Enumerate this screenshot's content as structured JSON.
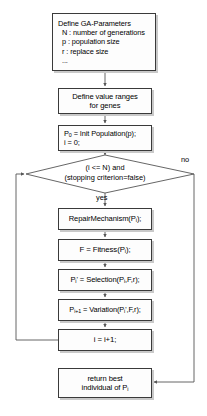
{
  "diagram": {
    "type": "flowchart",
    "colors": {
      "node_fill": "#fdfdfd",
      "node_border": "#3a3a3a",
      "shadow": "#c9c9c9",
      "line": "#555555",
      "background": "#ffffff"
    },
    "nodes": [
      {
        "id": "define-ga-parameters",
        "shape": "process",
        "lines": [
          "Define GA-Parameters",
          "N : number of generations",
          "p : population size",
          "r : replace size",
          "..."
        ]
      },
      {
        "id": "define-value-ranges",
        "shape": "process",
        "lines": [
          "Define value ranges",
          "for genes"
        ]
      },
      {
        "id": "init-population",
        "shape": "process",
        "lines": [
          "P0 = Init Population(p);",
          "i = 0;"
        ]
      },
      {
        "id": "loop-condition",
        "shape": "decision",
        "lines": [
          "(i <= N) and",
          "(stopping criterion=false)"
        ]
      },
      {
        "id": "repair-mechanism",
        "shape": "process",
        "lines": [
          "RepairMechanism(Pi);"
        ]
      },
      {
        "id": "fitness",
        "shape": "process",
        "lines": [
          "F = Fitness(Pi);"
        ]
      },
      {
        "id": "selection",
        "shape": "process",
        "lines": [
          "Pi' = Selection(Pi,F,r);"
        ]
      },
      {
        "id": "variation",
        "shape": "process",
        "lines": [
          "Pi+1 = Variation(Pi',F,r);"
        ]
      },
      {
        "id": "increment",
        "shape": "process",
        "lines": [
          "i = i+1;"
        ]
      },
      {
        "id": "return-best",
        "shape": "process",
        "lines": [
          "return best",
          "individual of Pi"
        ]
      }
    ],
    "edge_labels": {
      "yes": "yes",
      "no": "no"
    },
    "text": {
      "params_title": "Define GA-Parameters",
      "params_n": "N : number of generations",
      "params_p": "p : population size",
      "params_r": "r : replace size",
      "params_dots": "...",
      "ranges_l1": "Define value ranges",
      "ranges_l2": "for genes",
      "init_l1_pre": "P",
      "init_l1_sub": "0",
      "init_l1_post": " = Init Population(p);",
      "init_l2": "i = 0;",
      "cond_l1": "(i <= N) and",
      "cond_l2": "(stopping criterion=false)",
      "repair_pre": "RepairMechanism(P",
      "repair_sub": "i",
      "repair_post": ");",
      "fitness_pre": "F = Fitness(P",
      "fitness_sub": "i",
      "fitness_post": ");",
      "sel_pre": "P",
      "sel_sub1": "i",
      "sel_mid": "' = Selection(P",
      "sel_sub2": "i",
      "sel_post": ",F,r);",
      "var_pre": "P",
      "var_sub1": "i+1",
      "var_mid": " = Variation(P",
      "var_sub2": "i",
      "var_post": "',F,r);",
      "incr": "i = i+1;",
      "ret_l1": "return best",
      "ret_l2_pre": "individual of P",
      "ret_l2_sub": "i"
    }
  }
}
